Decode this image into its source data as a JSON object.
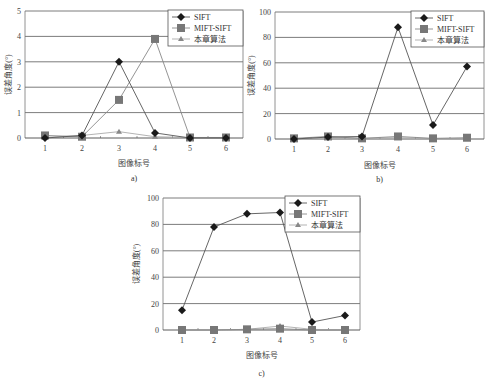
{
  "chart_data": [
    {
      "type": "line",
      "caption": "a)",
      "xlabel": "图像标号",
      "ylabel": "误差角度(°)",
      "categories": [
        "1",
        "2",
        "3",
        "4",
        "5",
        "6"
      ],
      "ylim": [
        0,
        5
      ],
      "yticks": [
        0,
        1,
        2,
        3,
        4,
        5
      ],
      "grid": true,
      "legend_position": "top-right",
      "series": [
        {
          "name": "SIFT",
          "marker": "diamond",
          "values": [
            0,
            0.1,
            3.0,
            0.2,
            0,
            0
          ]
        },
        {
          "name": "MIFT-SIFT",
          "marker": "square",
          "values": [
            0.1,
            0.05,
            1.5,
            3.9,
            0.02,
            0.02
          ]
        },
        {
          "name": "本章算法",
          "marker": "triangle",
          "values": [
            0.02,
            0.1,
            0.25,
            0.05,
            0.02,
            0.02
          ]
        }
      ],
      "layout": {
        "x0": 25,
        "x1": 243,
        "y0": 138,
        "y1": 11,
        "xs": [
          45,
          82,
          119,
          155,
          190,
          226
        ],
        "legend": {
          "x": 168,
          "y": 10,
          "w": 75,
          "h": 36
        },
        "xlabel_y": 166,
        "caption_y": 181,
        "ylabel_x": 11
      }
    },
    {
      "type": "line",
      "caption": "b)",
      "xlabel": "图像标号",
      "ylabel": "误差角度(°)",
      "categories": [
        "1",
        "2",
        "3",
        "4",
        "5",
        "6"
      ],
      "ylim": [
        0,
        100
      ],
      "yticks": [
        0,
        20,
        40,
        60,
        80,
        100
      ],
      "grid": true,
      "legend_position": "top-right",
      "series": [
        {
          "name": "SIFT",
          "marker": "diamond",
          "values": [
            0,
            1.5,
            2,
            88,
            11,
            57
          ]
        },
        {
          "name": "MIFT-SIFT",
          "marker": "square",
          "values": [
            0.5,
            2,
            0.5,
            2,
            0.5,
            1
          ]
        },
        {
          "name": "本章算法",
          "marker": "triangle",
          "values": [
            0.2,
            1,
            0.5,
            1,
            0.3,
            0.5
          ]
        }
      ],
      "layout": {
        "x0": 275,
        "x1": 484,
        "y0": 139,
        "y1": 12,
        "xs": [
          294,
          328,
          362,
          398,
          433,
          467
        ],
        "legend": {
          "x": 411,
          "y": 11,
          "w": 73,
          "h": 36
        },
        "xlabel_y": 168,
        "caption_y": 182,
        "ylabel_x": 254
      }
    },
    {
      "type": "line",
      "caption": "c)",
      "xlabel": "图像标号",
      "ylabel": "误差角度(°)",
      "categories": [
        "1",
        "2",
        "3",
        "4",
        "5",
        "6"
      ],
      "ylim": [
        0,
        100
      ],
      "yticks": [
        0,
        20,
        40,
        60,
        80,
        100
      ],
      "grid": true,
      "legend_position": "top-right",
      "series": [
        {
          "name": "SIFT",
          "marker": "diamond",
          "values": [
            15,
            78,
            88,
            89,
            6,
            11
          ]
        },
        {
          "name": "MIFT-SIFT",
          "marker": "square",
          "values": [
            0,
            0,
            0.5,
            1,
            0,
            0
          ]
        },
        {
          "name": "本章算法",
          "marker": "triangle",
          "values": [
            0,
            0,
            0.5,
            3,
            0.5,
            0
          ]
        }
      ],
      "layout": {
        "x0": 163,
        "x1": 360,
        "y0": 330,
        "y1": 198,
        "xs": [
          182,
          214,
          247,
          280,
          312,
          345
        ],
        "legend": {
          "x": 285,
          "y": 196,
          "w": 75,
          "h": 36
        },
        "xlabel_y": 358,
        "caption_y": 376,
        "ylabel_x": 139
      }
    }
  ],
  "styles": {
    "SIFT": {
      "color": "#1a1a1a",
      "line": "#555555"
    },
    "MIFT-SIFT": {
      "color": "#777777",
      "line": "#888888"
    },
    "本章算法": {
      "color": "#888888",
      "line": "#aaaaaa"
    },
    "grid": "#5a5a5a",
    "frame": "#777777"
  }
}
